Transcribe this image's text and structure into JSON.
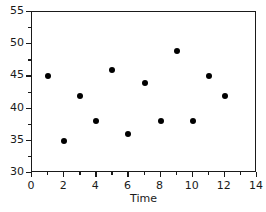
{
  "chart_data": {
    "type": "scatter",
    "title": "",
    "xlabel": "Time",
    "ylabel": "",
    "xlim": [
      0,
      14
    ],
    "ylim": [
      30,
      55
    ],
    "grid": false,
    "legend": null,
    "marker": "filled-circle",
    "marker_color": "#000000",
    "x": [
      1,
      2,
      3,
      4,
      5,
      6,
      7,
      8,
      9,
      10,
      11,
      12
    ],
    "values": [
      45,
      35,
      42,
      38,
      46,
      36,
      44,
      38,
      49,
      38,
      45,
      42
    ],
    "points": [
      {
        "x": 1,
        "y": 45
      },
      {
        "x": 2,
        "y": 35
      },
      {
        "x": 3,
        "y": 42
      },
      {
        "x": 4,
        "y": 38
      },
      {
        "x": 5,
        "y": 46
      },
      {
        "x": 6,
        "y": 36
      },
      {
        "x": 7,
        "y": 44
      },
      {
        "x": 8,
        "y": 38
      },
      {
        "x": 9,
        "y": 49
      },
      {
        "x": 10,
        "y": 38
      },
      {
        "x": 11,
        "y": 45
      },
      {
        "x": 12,
        "y": 42
      }
    ],
    "xticks": [
      0,
      2,
      4,
      6,
      8,
      10,
      12,
      14
    ],
    "xticklabels": [
      "0",
      "2",
      "4",
      "6",
      "8",
      "10",
      "12",
      "14"
    ],
    "xminorticks": [
      1,
      3,
      5,
      7,
      9,
      11,
      13
    ],
    "yticks": [
      30,
      35,
      40,
      45,
      50,
      55
    ],
    "yticklabels": [
      "30",
      "35",
      "40",
      "45",
      "50",
      "55"
    ],
    "yminorticks": [
      32.5,
      37.5,
      42.5,
      47.5,
      52.5
    ],
    "axis_color": "#1a1a1a",
    "background": "#ffffff"
  }
}
